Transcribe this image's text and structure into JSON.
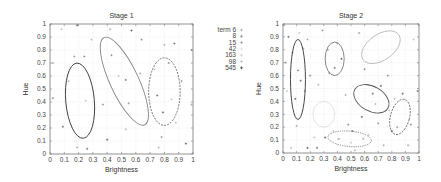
{
  "chart_data": [
    {
      "type": "scatter",
      "title": "Stage 1",
      "xlabel": "Brightness",
      "ylabel": "Hue",
      "xlim": [
        0,
        1
      ],
      "ylim": [
        0,
        1
      ],
      "xticks": [
        "0",
        "0.1",
        "0.2",
        "0.3",
        "0.4",
        "0.5",
        "0.6",
        "0.7",
        "0.8",
        "0.9",
        "1"
      ],
      "yticks": [
        "0",
        "0.1",
        "0.2",
        "0.3",
        "0.4",
        "0.5",
        "0.6",
        "0.7",
        "0.8",
        "0.9",
        "1"
      ],
      "grid": true,
      "legend": {
        "position": "right",
        "entries": [
          "term 6",
          "8",
          "15",
          "42",
          "163",
          "98",
          "545"
        ]
      },
      "ellipses": [
        {
          "cx": 0.21,
          "cy": 0.41,
          "rx": 0.1,
          "ry": 0.29,
          "angle": -5,
          "color": "#333333",
          "style": "solid"
        },
        {
          "cx": 0.52,
          "cy": 0.56,
          "rx": 0.1,
          "ry": 0.37,
          "angle": -25,
          "color": "#888888",
          "style": "solid"
        },
        {
          "cx": 0.8,
          "cy": 0.48,
          "rx": 0.11,
          "ry": 0.26,
          "angle": 0,
          "color": "#666666",
          "style": "dashed"
        }
      ],
      "points": [
        [
          0.02,
          0.7
        ],
        [
          0.02,
          0.43
        ],
        [
          0.08,
          0.96
        ],
        [
          0.09,
          0.21
        ],
        [
          0.13,
          0.56
        ],
        [
          0.17,
          0.75
        ],
        [
          0.19,
          0.99
        ],
        [
          0.19,
          0.05
        ],
        [
          0.24,
          0.75
        ],
        [
          0.25,
          0.41
        ],
        [
          0.26,
          0.04
        ],
        [
          0.29,
          0.88
        ],
        [
          0.37,
          0.38
        ],
        [
          0.4,
          0.11
        ],
        [
          0.42,
          0.96
        ],
        [
          0.43,
          0.76
        ],
        [
          0.48,
          0.6
        ],
        [
          0.53,
          0.57
        ],
        [
          0.53,
          0.19
        ],
        [
          0.55,
          0.39
        ],
        [
          0.57,
          0.95
        ],
        [
          0.63,
          0.62
        ],
        [
          0.64,
          0.88
        ],
        [
          0.73,
          0.65
        ],
        [
          0.75,
          0.45
        ],
        [
          0.76,
          0.05
        ],
        [
          0.78,
          0.13
        ],
        [
          0.79,
          0.32
        ],
        [
          0.8,
          0.84
        ],
        [
          0.83,
          0.7
        ],
        [
          0.85,
          0.42
        ],
        [
          0.87,
          0.85
        ],
        [
          0.88,
          0.24
        ],
        [
          0.92,
          0.56
        ],
        [
          0.95,
          0.08
        ],
        [
          0.99,
          0.38
        ],
        [
          0.99,
          0.8
        ]
      ]
    },
    {
      "type": "scatter",
      "title": "Stage 2",
      "xlabel": "Brightness",
      "ylabel": "Hue",
      "xlim": [
        0,
        1
      ],
      "ylim": [
        0,
        1
      ],
      "xticks": [
        "0",
        "0.1",
        "0.2",
        "0.3",
        "0.4",
        "0.5",
        "0.6",
        "0.7",
        "0.8",
        "0.9",
        "1"
      ],
      "yticks": [
        "0",
        "0.1",
        "0.2",
        "0.3",
        "0.4",
        "0.5",
        "0.6",
        "0.7",
        "0.8",
        "0.9",
        "1"
      ],
      "grid": true,
      "ellipses": [
        {
          "cx": 0.11,
          "cy": 0.57,
          "rx": 0.055,
          "ry": 0.31,
          "angle": 0,
          "color": "#333333",
          "style": "solid"
        },
        {
          "cx": 0.38,
          "cy": 0.73,
          "rx": 0.07,
          "ry": 0.13,
          "angle": 0,
          "color": "#777777",
          "style": "solid"
        },
        {
          "cx": 0.72,
          "cy": 0.82,
          "rx": 0.16,
          "ry": 0.1,
          "angle": -35,
          "color": "#bbbbbb",
          "style": "solid"
        },
        {
          "cx": 0.65,
          "cy": 0.42,
          "rx": 0.14,
          "ry": 0.095,
          "angle": 30,
          "color": "#555555",
          "style": "solid"
        },
        {
          "cx": 0.3,
          "cy": 0.3,
          "rx": 0.08,
          "ry": 0.1,
          "angle": 0,
          "color": "#e0e0e0",
          "style": "solid"
        },
        {
          "cx": 0.86,
          "cy": 0.28,
          "rx": 0.07,
          "ry": 0.14,
          "angle": 15,
          "color": "#666666",
          "style": "dashed"
        },
        {
          "cx": 0.49,
          "cy": 0.11,
          "rx": 0.16,
          "ry": 0.06,
          "angle": 5,
          "color": "#666666",
          "style": "dotted"
        }
      ],
      "points": [
        [
          0.01,
          0.99
        ],
        [
          0.02,
          0.7
        ],
        [
          0.03,
          0.48
        ],
        [
          0.04,
          0.9
        ],
        [
          0.06,
          0.04
        ],
        [
          0.07,
          0.78
        ],
        [
          0.09,
          0.42
        ],
        [
          0.1,
          0.21
        ],
        [
          0.11,
          0.64
        ],
        [
          0.12,
          0.93
        ],
        [
          0.13,
          0.56
        ],
        [
          0.15,
          0.81
        ],
        [
          0.16,
          0.48
        ],
        [
          0.18,
          0.04
        ],
        [
          0.18,
          0.88
        ],
        [
          0.2,
          0.6
        ],
        [
          0.23,
          0.12
        ],
        [
          0.25,
          0.04
        ],
        [
          0.26,
          0.53
        ],
        [
          0.29,
          0.95
        ],
        [
          0.31,
          0.12
        ],
        [
          0.33,
          0.8
        ],
        [
          0.34,
          0.62
        ],
        [
          0.37,
          0.17
        ],
        [
          0.38,
          0.66
        ],
        [
          0.4,
          0.85
        ],
        [
          0.41,
          0.11
        ],
        [
          0.43,
          0.73
        ],
        [
          0.46,
          0.45
        ],
        [
          0.48,
          0.22
        ],
        [
          0.5,
          0.08
        ],
        [
          0.51,
          0.17
        ],
        [
          0.53,
          0.02
        ],
        [
          0.56,
          0.93
        ],
        [
          0.58,
          0.28
        ],
        [
          0.59,
          0.11
        ],
        [
          0.6,
          0.65
        ],
        [
          0.63,
          0.14
        ],
        [
          0.66,
          0.46
        ],
        [
          0.68,
          0.38
        ],
        [
          0.7,
          0.23
        ],
        [
          0.72,
          0.52
        ],
        [
          0.74,
          0.06
        ],
        [
          0.77,
          0.6
        ],
        [
          0.78,
          0.33
        ],
        [
          0.8,
          0.17
        ],
        [
          0.82,
          0.42
        ],
        [
          0.84,
          0.2
        ],
        [
          0.88,
          0.46
        ],
        [
          0.92,
          0.06
        ],
        [
          0.94,
          0.22
        ],
        [
          0.96,
          0.88
        ],
        [
          0.99,
          0.48
        ]
      ]
    }
  ]
}
